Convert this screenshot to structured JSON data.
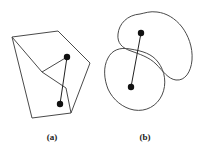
{
  "figure": {
    "background_color": "#ffffff",
    "stroke_color": "#4a4a4a",
    "dot_color": "#111111",
    "connector_color": "#222222",
    "stroke_width": 1,
    "panels": [
      {
        "id": "panel-a",
        "caption": "(a)",
        "caption_x": 52,
        "caption_y": 132,
        "shape_type": "polygon",
        "shape_name": "concave-polygon-with-notch",
        "polygon_points": "12,37 58,31 90,63 66,88 71,113 32,118",
        "notch_points": "12,37 42,72 66,88",
        "outline_path": "M 12 37 L 58 31 L 90 63 L 66 88 L 71 113 L 32 118 Z",
        "inner_notch_path": "M 42 72 L 66 88 M 42 72 L 67 57",
        "dots": [
          {
            "name": "upper-vertex-dot",
            "x": 67,
            "y": 57,
            "r": 3.2
          },
          {
            "name": "lower-vertex-dot",
            "x": 60,
            "y": 104,
            "r": 3.2
          }
        ],
        "connector": {
          "x1": 67,
          "y1": 57,
          "x2": 60,
          "y2": 104
        }
      },
      {
        "id": "panel-b",
        "caption": "(b)",
        "caption_x": 145,
        "caption_y": 132,
        "shape_type": "blobs",
        "shape_name": "two-overlapping-closed-curves",
        "blob_upper_path": "M 140 14 C 127 15 119 24 118 34 C 117 43 122 48 131 51 C 139 54 149 57 156 64 C 163 71 168 79 176 80 C 185 81 191 72 192 60 C 193 47 188 35 182 27 C 175 18 166 13 157 12 C 150 11 145 13 140 14 Z",
        "blob_lower_path": "M 130 49 C 120 47 112 50 108 58 C 103 67 104 79 108 89 C 113 100 123 108 134 110 C 146 112 157 106 162 95 C 167 84 165 71 158 62 C 152 54 143 51 130 49 Z",
        "dots": [
          {
            "name": "upper-blob-dot",
            "x": 141,
            "y": 33,
            "r": 3.2
          },
          {
            "name": "lower-blob-dot",
            "x": 131,
            "y": 87,
            "r": 3.2
          }
        ],
        "connector": {
          "x1": 141,
          "y1": 33,
          "x2": 131,
          "y2": 87
        }
      }
    ]
  }
}
